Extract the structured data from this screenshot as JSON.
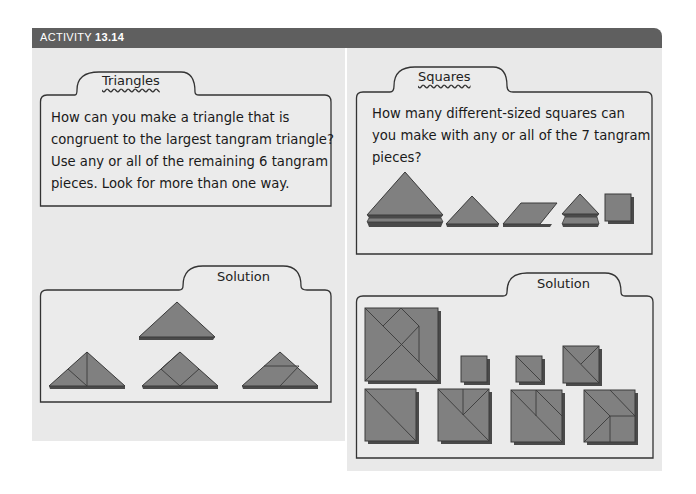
{
  "header": {
    "prefix": "ACTIVITY ",
    "number": "13.14",
    "bg_color": "#5f5f5f"
  },
  "left": {
    "tab_title": "Triangles",
    "question_lines": [
      "How can you make a triangle that is",
      "congruent to the largest tangram triangle?",
      "Use any or all of the remaining 6 tangram",
      "pieces. Look for more than one way."
    ],
    "solution_label": "Solution"
  },
  "right": {
    "tab_title": "Squares",
    "question_lines": [
      "How many different-sized squares can",
      "you make with any or all of the 7 tangram",
      "pieces?"
    ],
    "pieces": [
      "2 large triangles",
      "medium triangle",
      "parallelogram",
      "2 small triangles",
      "square"
    ],
    "solution_label": "Solution"
  },
  "colors": {
    "panel_bg": "#e9e9e9",
    "piece_fill": "#808080",
    "piece_shadow": "#4a4a4a"
  }
}
